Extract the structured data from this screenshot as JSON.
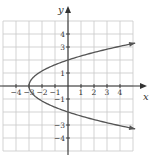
{
  "chart_data": {
    "type": "line",
    "title": "",
    "xlabel": "x",
    "ylabel": "y",
    "xlim": [
      -5,
      5
    ],
    "ylim": [
      -5,
      5
    ],
    "grid": true,
    "x_tick_labels": [
      "-4",
      "-3",
      "-2",
      "-1",
      "1",
      "2",
      "3",
      "4"
    ],
    "y_tick_labels": [
      "4",
      "3",
      "1",
      "-1",
      "-3",
      "-4"
    ],
    "series": [
      {
        "name": "x = (3/4)y^2 - 3",
        "equation": "x = 0.75*y^2 - 3",
        "vertex": [
          -3,
          0
        ],
        "points": [
          [
            4.9,
            3.3
          ],
          [
            4.0,
            2.97
          ],
          [
            3.0,
            2.83
          ],
          [
            2.0,
            2.58
          ],
          [
            1.0,
            2.31
          ],
          [
            0.0,
            2.0
          ],
          [
            -1.0,
            1.63
          ],
          [
            -2.0,
            1.15
          ],
          [
            -2.5,
            0.82
          ],
          [
            -3.0,
            0.0
          ],
          [
            -2.5,
            -0.82
          ],
          [
            -2.0,
            -1.15
          ],
          [
            -1.0,
            -1.63
          ],
          [
            0.0,
            -2.0
          ],
          [
            1.0,
            -2.31
          ],
          [
            2.0,
            -2.58
          ],
          [
            3.0,
            -2.83
          ],
          [
            4.0,
            -2.97
          ],
          [
            4.9,
            -3.3
          ]
        ],
        "arrows": "both ends",
        "color": "#555555"
      }
    ]
  }
}
